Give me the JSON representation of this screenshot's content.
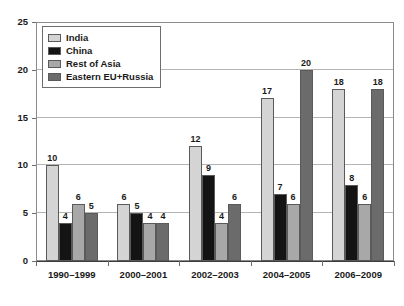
{
  "chart_data": {
    "type": "bar",
    "title": "",
    "subtitle": "",
    "xlabel": "",
    "ylabel": "",
    "categories": [
      "1990–1999",
      "2000–2001",
      "2002–2003",
      "2004–2005",
      "2006–2009"
    ],
    "series": [
      {
        "name": "India",
        "color": "#d4d4d4",
        "values": [
          10,
          6,
          12,
          17,
          18
        ]
      },
      {
        "name": "China",
        "color": "#141414",
        "values": [
          4,
          5,
          9,
          7,
          8
        ]
      },
      {
        "name": "Rest of Asia",
        "color": "#a8a8a8",
        "values": [
          6,
          4,
          4,
          6,
          6
        ]
      },
      {
        "name": "Eastern EU+Russia",
        "color": "#6b6b6b",
        "values": [
          5,
          4,
          6,
          20,
          18
        ]
      }
    ],
    "ylim": [
      0,
      25
    ],
    "ytick_labels": [
      "0",
      "5",
      "10",
      "15",
      "20",
      "25"
    ],
    "ytick_values": [
      0,
      5,
      10,
      15,
      20,
      25
    ],
    "grid": true,
    "grid_axis": "y",
    "legend_position": "upper-left-inside",
    "value_labels": true,
    "group_order": [
      "India",
      "China",
      "Rest of Asia",
      "Eastern EU+Russia"
    ]
  },
  "legend": {
    "items": [
      {
        "label": "India"
      },
      {
        "label": "China"
      },
      {
        "label": "Rest of Asia"
      },
      {
        "label": "Eastern EU+Russia"
      }
    ]
  }
}
